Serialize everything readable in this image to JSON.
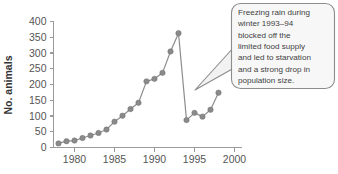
{
  "chart_data": {
    "type": "line",
    "title": "",
    "xlabel": "",
    "ylabel": "No. animals",
    "xlim": [
      1977.5,
      2000.5
    ],
    "ylim": [
      0,
      400
    ],
    "grid": false,
    "legend": "none",
    "x_ticks": [
      "1980",
      "1985",
      "1990",
      "1995",
      "2000"
    ],
    "x_tick_values": [
      1980,
      1985,
      1990,
      1995,
      2000
    ],
    "y_ticks": [
      "0",
      "50",
      "100",
      "150",
      "200",
      "250",
      "300",
      "350",
      "400"
    ],
    "y_tick_values": [
      0,
      50,
      100,
      150,
      200,
      250,
      300,
      350,
      400
    ],
    "series": [
      {
        "name": "No. animals",
        "marker": "circle",
        "color": "#8a8a8a",
        "x": [
          1978,
          1979,
          1980,
          1981,
          1982,
          1983,
          1984,
          1985,
          1986,
          1987,
          1988,
          1989,
          1990,
          1991,
          1992,
          1993,
          1994,
          1995,
          1996,
          1997,
          1998
        ],
        "values": [
          13,
          20,
          22,
          30,
          38,
          46,
          57,
          82,
          101,
          122,
          142,
          210,
          218,
          237,
          305,
          363,
          87,
          110,
          98,
          120,
          174
        ]
      }
    ],
    "annotations": [
      {
        "name": "freezing-rain-callout",
        "text": "Freezing rain during winter 1993–94 blocked off the limited food supply and led to starvation and a strong drop in population size.",
        "lines": [
          "Freezing rain during",
          "winter 1993–94",
          "blocked off the",
          "limited food supply",
          "and led to starvation",
          "and a strong drop in",
          "population size."
        ],
        "points_to": {
          "x": 1994,
          "y": 87
        }
      }
    ]
  },
  "colors": {
    "series": "#8a8a8a",
    "axis": "#9a9a9a",
    "text": "#444444",
    "callout_fill": "#f7f7f7",
    "callout_border": "#8c8c8c"
  }
}
